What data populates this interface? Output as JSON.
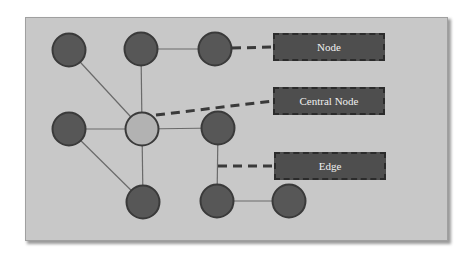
{
  "diagram": {
    "type": "network-graph",
    "colors": {
      "background": "#c8c8c8",
      "node_fill": "#575757",
      "node_stroke": "#3a3a3a",
      "central_node_fill": "#b2b2b2",
      "edge": "#6a6a6a",
      "label_box_fill": "#4e4e4e",
      "label_text": "#f0f0f0",
      "dash": "#3a3a3a"
    },
    "nodes": [
      {
        "id": "n1",
        "x": 69,
        "y": 50,
        "central": false
      },
      {
        "id": "n2",
        "x": 141,
        "y": 49,
        "central": false
      },
      {
        "id": "n3",
        "x": 215,
        "y": 49,
        "central": false
      },
      {
        "id": "n4",
        "x": 69,
        "y": 129,
        "central": false
      },
      {
        "id": "n5",
        "x": 142,
        "y": 129,
        "central": true
      },
      {
        "id": "n6",
        "x": 218,
        "y": 128,
        "central": false
      },
      {
        "id": "n7",
        "x": 143,
        "y": 202,
        "central": false
      },
      {
        "id": "n8",
        "x": 217,
        "y": 201,
        "central": false
      },
      {
        "id": "n9",
        "x": 289,
        "y": 201,
        "central": false
      }
    ],
    "edges": [
      [
        "n1",
        "n5"
      ],
      [
        "n2",
        "n5"
      ],
      [
        "n2",
        "n3"
      ],
      [
        "n4",
        "n5"
      ],
      [
        "n5",
        "n6"
      ],
      [
        "n5",
        "n7"
      ],
      [
        "n4",
        "n7"
      ],
      [
        "n6",
        "n8"
      ],
      [
        "n8",
        "n9"
      ]
    ],
    "labels": [
      {
        "text": "Node",
        "x": 273,
        "y": 33,
        "points_from": [
          232,
          48
        ]
      },
      {
        "text": "Central Node",
        "x": 273,
        "y": 87,
        "points_from": [
          156,
          115
        ]
      },
      {
        "text": "Edge",
        "x": 274,
        "y": 152,
        "points_from": [
          218,
          166
        ]
      }
    ]
  }
}
